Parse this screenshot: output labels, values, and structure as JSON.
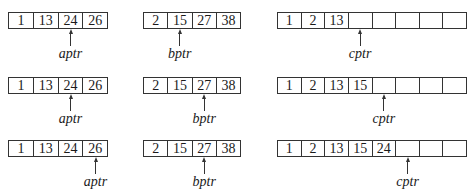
{
  "diagram": {
    "title": "",
    "pointer_labels": {
      "a": "aptr",
      "b": "bptr",
      "c": "cptr"
    },
    "steps": [
      {
        "A": [
          "1",
          "13",
          "24",
          "26"
        ],
        "B": [
          "2",
          "15",
          "27",
          "38"
        ],
        "C": [
          "1",
          "2",
          "13",
          "",
          "",
          "",
          "",
          ""
        ],
        "aptr_index": 2,
        "bptr_index": 1,
        "cptr_index": 3
      },
      {
        "A": [
          "1",
          "13",
          "24",
          "26"
        ],
        "B": [
          "2",
          "15",
          "27",
          "38"
        ],
        "C": [
          "1",
          "2",
          "13",
          "15",
          "",
          "",
          "",
          ""
        ],
        "aptr_index": 2,
        "bptr_index": 2,
        "cptr_index": 4
      },
      {
        "A": [
          "1",
          "13",
          "24",
          "26"
        ],
        "B": [
          "2",
          "15",
          "27",
          "38"
        ],
        "C": [
          "1",
          "2",
          "13",
          "15",
          "24",
          "",
          "",
          ""
        ],
        "aptr_index": 3,
        "bptr_index": 2,
        "cptr_index": 5
      }
    ]
  },
  "colors": {
    "line": "#333333",
    "text": "#1a1a1a",
    "background": "#ffffff"
  }
}
